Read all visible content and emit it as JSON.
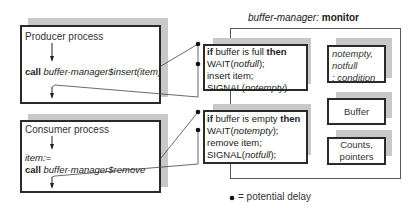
{
  "monitor": {
    "name": "buffer-manager",
    "separator": ": ",
    "type": "monitor"
  },
  "producer": {
    "title": "Producer process",
    "call_keyword": "call",
    "call_target": "buffer-manager$insert(item)"
  },
  "consumer": {
    "title": "Consumer process",
    "assign": "item:=",
    "call_keyword": "call",
    "call_target": "buffer-manager$remove"
  },
  "insert_procedure": {
    "lines": [
      {
        "kw1": "if",
        "text": " buffer is full ",
        "kw2": "then"
      },
      {
        "pre": "WAIT(",
        "arg": "notfull",
        "post": ");"
      },
      {
        "text": "insert item;"
      },
      {
        "pre": "SIGNAL(",
        "arg": "notempty",
        "post": ")"
      }
    ]
  },
  "remove_procedure": {
    "lines": [
      {
        "kw1": "if",
        "text": " buffer is empty ",
        "kw2": "then"
      },
      {
        "pre": "WAIT(",
        "arg": "notempty",
        "post": ");"
      },
      {
        "text": "remove item;"
      },
      {
        "pre": "SIGNAL(",
        "arg": "notfull",
        "post": ");"
      }
    ]
  },
  "monitor_data": {
    "conditions": [
      "notempty,",
      "notfull",
      ": condition"
    ],
    "buffer": "Buffer",
    "counts": [
      "Counts,",
      "pointers"
    ]
  },
  "legend": {
    "text": "= potential delay"
  },
  "colors": {
    "border": "#2a2a2a",
    "shadow": "#c8c8c8",
    "frame": "#555555",
    "dot": "#111111"
  }
}
